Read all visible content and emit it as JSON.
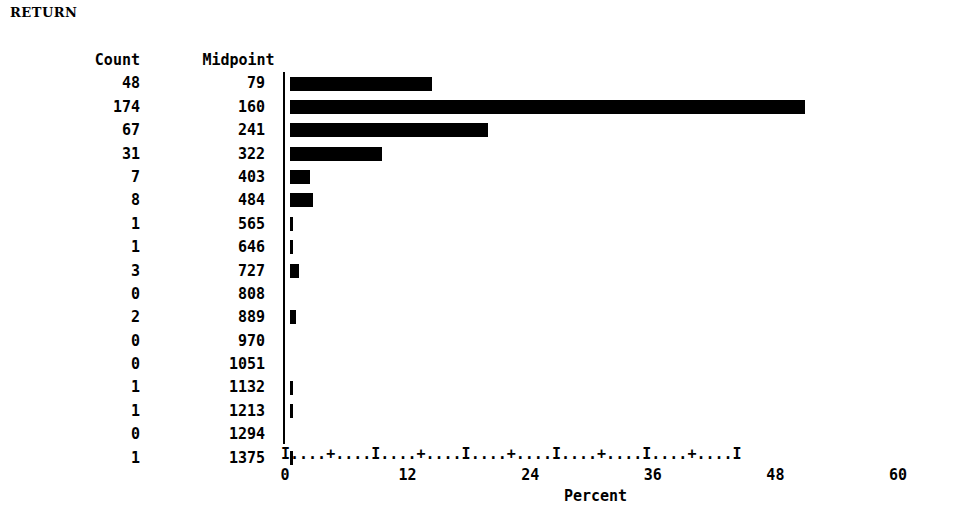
{
  "chart_title": "RETURN",
  "table": {
    "headers": [
      "Count",
      "Midpoint"
    ],
    "rows": [
      {
        "count": "48",
        "midpoint": "79",
        "percent": 13.9
      },
      {
        "count": "174",
        "midpoint": "160",
        "percent": 50.4
      },
      {
        "count": "67",
        "midpoint": "241",
        "percent": 19.4
      },
      {
        "count": "31",
        "midpoint": "322",
        "percent": 9.0
      },
      {
        "count": "7",
        "midpoint": "403",
        "percent": 2.0
      },
      {
        "count": "8",
        "midpoint": "484",
        "percent": 2.3
      },
      {
        "count": "1",
        "midpoint": "565",
        "percent": 0.3
      },
      {
        "count": "1",
        "midpoint": "646",
        "percent": 0.3
      },
      {
        "count": "3",
        "midpoint": "727",
        "percent": 0.9
      },
      {
        "count": "0",
        "midpoint": "808",
        "percent": 0.0
      },
      {
        "count": "2",
        "midpoint": "889",
        "percent": 0.6
      },
      {
        "count": "0",
        "midpoint": "970",
        "percent": 0.0
      },
      {
        "count": "0",
        "midpoint": "1051",
        "percent": 0.0
      },
      {
        "count": "1",
        "midpoint": "1132",
        "percent": 0.3
      },
      {
        "count": "1",
        "midpoint": "1213",
        "percent": 0.3
      },
      {
        "count": "0",
        "midpoint": "1294",
        "percent": 0.0
      },
      {
        "count": "1",
        "midpoint": "1375",
        "percent": 0.3
      }
    ]
  },
  "axis": {
    "ruler": "I....+....I....+....I....+....I....+....I....+....I",
    "ticks": [
      "0",
      "12",
      "24",
      "36",
      "48",
      "60"
    ],
    "title": "Percent",
    "min": 0,
    "max": 60
  },
  "chart_data": {
    "type": "bar",
    "orientation": "horizontal",
    "title": "RETURN",
    "xlabel": "Percent",
    "ylabel": "Midpoint",
    "xlim": [
      0,
      60
    ],
    "xticks": [
      0,
      12,
      24,
      36,
      48,
      60
    ],
    "grid": false,
    "legend": "none",
    "categories": [
      "79",
      "160",
      "241",
      "322",
      "403",
      "484",
      "565",
      "646",
      "727",
      "808",
      "889",
      "970",
      "1051",
      "1132",
      "1213",
      "1294",
      "1375"
    ],
    "series": [
      {
        "name": "Count",
        "values": [
          48,
          174,
          67,
          31,
          7,
          8,
          1,
          1,
          3,
          0,
          2,
          0,
          0,
          1,
          1,
          0,
          1
        ]
      },
      {
        "name": "Percent",
        "values": [
          13.9,
          50.4,
          19.4,
          9.0,
          2.0,
          2.3,
          0.3,
          0.3,
          0.9,
          0.0,
          0.6,
          0.0,
          0.0,
          0.3,
          0.3,
          0.0,
          0.3
        ]
      }
    ],
    "total_count": 345,
    "bar_color": "#000000",
    "background_color": "#ffffff"
  }
}
